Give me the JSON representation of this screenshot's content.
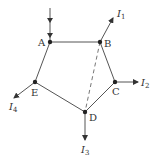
{
  "diagram": {
    "type": "current-network",
    "colors": {
      "line": "#555555",
      "node": "#222222",
      "dashed": "#777777",
      "text": "#333333"
    },
    "nodes": [
      {
        "id": "A",
        "label": "A",
        "x": 50,
        "y": 42
      },
      {
        "id": "B",
        "label": "B",
        "x": 100,
        "y": 42
      },
      {
        "id": "C",
        "label": "C",
        "x": 115,
        "y": 82
      },
      {
        "id": "D",
        "label": "D",
        "x": 85,
        "y": 112
      },
      {
        "id": "E",
        "label": "E",
        "x": 35,
        "y": 82
      }
    ],
    "edges": [
      {
        "from": "A",
        "to": "B",
        "style": "solid"
      },
      {
        "from": "B",
        "to": "C",
        "style": "solid"
      },
      {
        "from": "C",
        "to": "D",
        "style": "solid"
      },
      {
        "from": "D",
        "to": "E",
        "style": "solid"
      },
      {
        "from": "E",
        "to": "A",
        "style": "solid"
      },
      {
        "from": "B",
        "to": "D",
        "style": "dashed"
      }
    ],
    "currents": [
      {
        "id": "I_in",
        "node": "A",
        "direction": "in",
        "label": "",
        "subscript": ""
      },
      {
        "id": "I1",
        "node": "B",
        "direction": "out",
        "label": "I",
        "subscript": "1"
      },
      {
        "id": "I2",
        "node": "C",
        "direction": "out",
        "label": "I",
        "subscript": "2"
      },
      {
        "id": "I3",
        "node": "D",
        "direction": "out",
        "label": "I",
        "subscript": "3"
      },
      {
        "id": "I4",
        "node": "E",
        "direction": "out",
        "label": "I",
        "subscript": "4"
      }
    ]
  }
}
